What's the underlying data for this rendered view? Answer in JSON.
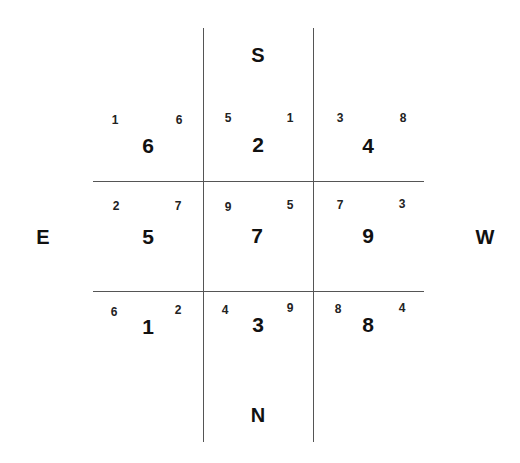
{
  "directions": {
    "top": "S",
    "bottom": "N",
    "left": "E",
    "right": "W"
  },
  "grid": {
    "rows": [
      [
        {
          "main": "6",
          "left": "1",
          "right": "6"
        },
        {
          "main": "2",
          "left": "5",
          "right": "1"
        },
        {
          "main": "4",
          "left": "3",
          "right": "8"
        }
      ],
      [
        {
          "main": "5",
          "left": "2",
          "right": "7"
        },
        {
          "main": "7",
          "left": "9",
          "right": "5"
        },
        {
          "main": "9",
          "left": "7",
          "right": "3"
        }
      ],
      [
        {
          "main": "1",
          "left": "6",
          "right": "2"
        },
        {
          "main": "3",
          "left": "4",
          "right": "9"
        },
        {
          "main": "8",
          "left": "8",
          "right": "4"
        }
      ]
    ]
  }
}
